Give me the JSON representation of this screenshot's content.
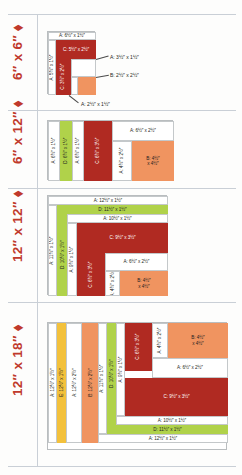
{
  "document": {
    "title": "Block Cutting Diagrams",
    "accent_color": "#c0392b",
    "palette": {
      "white": "#ffffff",
      "dark_red": "#b02a22",
      "orange": "#f09460",
      "green": "#b0d24a",
      "yellow": "#f3c13c"
    }
  },
  "sections": [
    {
      "id": "block-6x6",
      "label": "6″ x 6″ ⬧",
      "pieces": [
        {
          "name": "A: 6½″ x 1½″",
          "color": "white",
          "orientation": "horizontal"
        },
        {
          "name": "A: 5½″ x 1½″",
          "color": "white",
          "orientation": "vertical"
        },
        {
          "name": "C: 5½″ x 2½″",
          "color": "dark_red",
          "orientation": "horizontal"
        },
        {
          "name": "C: 3½″ x 2½″",
          "color": "dark_red",
          "orientation": "vertical"
        },
        {
          "name": "A: 2½″ x 1½″",
          "color": "white",
          "orientation": "vertical"
        },
        {
          "name": "B: 2½″ x 2½″",
          "color": "orange",
          "orientation": "horizontal"
        }
      ],
      "callouts": [
        "A: 3½″ x 1½″",
        "B: 2½″ x 2½″",
        "A: 2½″ x 1½″"
      ]
    },
    {
      "id": "block-6x12",
      "label": "6″ x 12″ ⬧",
      "pieces": [
        {
          "name": "A: 6½″ x 1½″",
          "color": "white",
          "orientation": "vertical"
        },
        {
          "name": "D: 6½″ x 1½″",
          "color": "green",
          "orientation": "vertical"
        },
        {
          "name": "A: 6½″ x 1½″",
          "color": "white",
          "orientation": "vertical"
        },
        {
          "name": "C: 6½″ x 3½″",
          "color": "dark_red",
          "orientation": "vertical"
        },
        {
          "name": "A: 6½″ x 2½″",
          "color": "white",
          "orientation": "horizontal"
        },
        {
          "name": "A: 4½″ x 2½″",
          "color": "white",
          "orientation": "vertical"
        },
        {
          "name": "B: 4½″ x 4½″",
          "color": "orange",
          "orientation": "horizontal"
        }
      ],
      "callouts": []
    },
    {
      "id": "block-12x12",
      "label": "12″ x 12″ ⬧",
      "pieces": [
        {
          "name": "A: 12½″ x 1½″",
          "color": "white",
          "orientation": "horizontal"
        },
        {
          "name": "D: 11½″ x 1½″",
          "color": "green",
          "orientation": "horizontal"
        },
        {
          "name": "A: 10½″ x 1½″",
          "color": "white",
          "orientation": "horizontal"
        },
        {
          "name": "A: 11½″ x 1½″",
          "color": "white",
          "orientation": "vertical"
        },
        {
          "name": "D: 10½″ x 1½″",
          "color": "green",
          "orientation": "vertical"
        },
        {
          "name": "A: 9½″ x 1½″",
          "color": "white",
          "orientation": "vertical"
        },
        {
          "name": "C: 9½″ x 3½″",
          "color": "dark_red",
          "orientation": "horizontal"
        },
        {
          "name": "C: 6½″ x 3½″",
          "color": "dark_red",
          "orientation": "vertical"
        },
        {
          "name": "A: 6½″ x 2½″",
          "color": "white",
          "orientation": "horizontal"
        },
        {
          "name": "A: 4½″ x 2½″",
          "color": "white",
          "orientation": "vertical"
        },
        {
          "name": "B: 4½″ x 4½″",
          "color": "orange",
          "orientation": "horizontal"
        }
      ],
      "callouts": []
    },
    {
      "id": "block-12x18",
      "label": "12″ x 18″ ⬧",
      "pieces": [
        {
          "name": "A: 12½″ x 1½″",
          "color": "white",
          "orientation": "vertical"
        },
        {
          "name": "E: 12½″ x 1½″",
          "color": "yellow",
          "orientation": "vertical"
        },
        {
          "name": "A: 12½″ x 2½″",
          "color": "white",
          "orientation": "vertical"
        },
        {
          "name": "B: 12½″ x 2½″",
          "color": "orange",
          "orientation": "vertical"
        },
        {
          "name": "A: 11½″ x 1½″",
          "color": "white",
          "orientation": "vertical"
        },
        {
          "name": "D: 10½″ x 1½″",
          "color": "green",
          "orientation": "vertical"
        },
        {
          "name": "A: 9½″ x 1½″",
          "color": "white",
          "orientation": "vertical"
        },
        {
          "name": "C: 6½″ x 3½″",
          "color": "dark_red",
          "orientation": "vertical"
        },
        {
          "name": "A: 4½″ x 2½″",
          "color": "white",
          "orientation": "vertical"
        },
        {
          "name": "B: 4½″ x 4½″",
          "color": "orange",
          "orientation": "horizontal"
        },
        {
          "name": "A: 6½″ x 2½″",
          "color": "white",
          "orientation": "horizontal"
        },
        {
          "name": "C: 9½″ x 3½″",
          "color": "dark_red",
          "orientation": "horizontal"
        },
        {
          "name": "A: 10½″ x 1½″",
          "color": "white",
          "orientation": "horizontal"
        },
        {
          "name": "D: 11½″ x 1½″",
          "color": "green",
          "orientation": "horizontal"
        },
        {
          "name": "A: 12½″ x 1½″",
          "color": "white",
          "orientation": "horizontal"
        }
      ],
      "callouts": []
    }
  ]
}
